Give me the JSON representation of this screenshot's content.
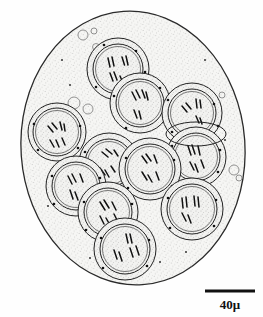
{
  "figure": {
    "background_color": "#fefefe",
    "ink_color": "#1a1a1a",
    "cytoplasm_fill": "#f4f4f2",
    "nucleoplasm_fill": "#f0f0ee"
  },
  "scale_bar": {
    "label": "40μ",
    "value": 40,
    "unit": "μ",
    "bar_x1": 205,
    "bar_x2": 255,
    "bar_y": 291,
    "bar_thickness": 3,
    "label_x": 230,
    "label_y": 309,
    "color": "#111111"
  },
  "cell": {
    "name": "oocyte-outline",
    "cx": 133,
    "cy": 148,
    "rx": 112,
    "ry": 137,
    "rotation": -4,
    "stroke": "#2a2a2a",
    "stroke_width": 1.3
  },
  "nuclei": [
    {
      "id": "n1",
      "cx": 118,
      "cy": 69,
      "r": 30,
      "chromosomes": 4
    },
    {
      "id": "n2",
      "cx": 140,
      "cy": 103,
      "r": 29,
      "chromosomes": 4
    },
    {
      "id": "n3",
      "cx": 192,
      "cy": 113,
      "r": 29,
      "chromosomes": 4
    },
    {
      "id": "n4",
      "cx": 196,
      "cy": 157,
      "r": 29,
      "chromosomes": 4
    },
    {
      "id": "n5",
      "cx": 57,
      "cy": 132,
      "r": 28,
      "chromosomes": 4
    },
    {
      "id": "n6",
      "cx": 109,
      "cy": 163,
      "r": 29,
      "chromosomes": 4
    },
    {
      "id": "n7",
      "cx": 150,
      "cy": 169,
      "r": 30,
      "chromosomes": 4
    },
    {
      "id": "n8",
      "cx": 76,
      "cy": 186,
      "r": 29,
      "chromosomes": 4
    },
    {
      "id": "n9",
      "cx": 108,
      "cy": 212,
      "r": 29,
      "chromosomes": 4
    },
    {
      "id": "n10",
      "cx": 192,
      "cy": 209,
      "r": 30,
      "chromosomes": 4
    },
    {
      "id": "n11",
      "cx": 125,
      "cy": 249,
      "r": 30,
      "chromosomes": 4
    }
  ],
  "vacuoles": [
    {
      "cx": 83,
      "cy": 35,
      "r": 5
    },
    {
      "cx": 94,
      "cy": 31,
      "r": 3
    },
    {
      "cx": 74,
      "cy": 103,
      "r": 6
    },
    {
      "cx": 88,
      "cy": 109,
      "r": 5
    },
    {
      "cx": 188,
      "cy": 23,
      "r": 4
    },
    {
      "cx": 33,
      "cy": 230,
      "r": 6
    },
    {
      "cx": 234,
      "cy": 170,
      "r": 5
    },
    {
      "cx": 239,
      "cy": 178,
      "r": 3
    },
    {
      "cx": 194,
      "cy": 272,
      "r": 6
    },
    {
      "cx": 78,
      "cy": 283,
      "r": 5
    },
    {
      "cx": 86,
      "cy": 290,
      "r": 4
    },
    {
      "cx": 71,
      "cy": 274,
      "r": 3
    },
    {
      "cx": 55,
      "cy": 261,
      "r": 3
    }
  ],
  "legend": {
    "caption": ""
  }
}
